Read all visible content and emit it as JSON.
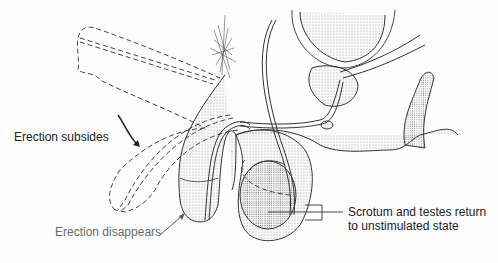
{
  "diagram": {
    "labels": {
      "erection_subsides": "Erection subsides",
      "erection_disappears": "Erection disappears",
      "scrotum_line1": "Scrotum and testes return",
      "scrotum_line2": "to unstimulated state"
    },
    "colors": {
      "line": "#333333",
      "stipple": "#9a9a9a",
      "gray_label": "#6a6a6a"
    }
  }
}
